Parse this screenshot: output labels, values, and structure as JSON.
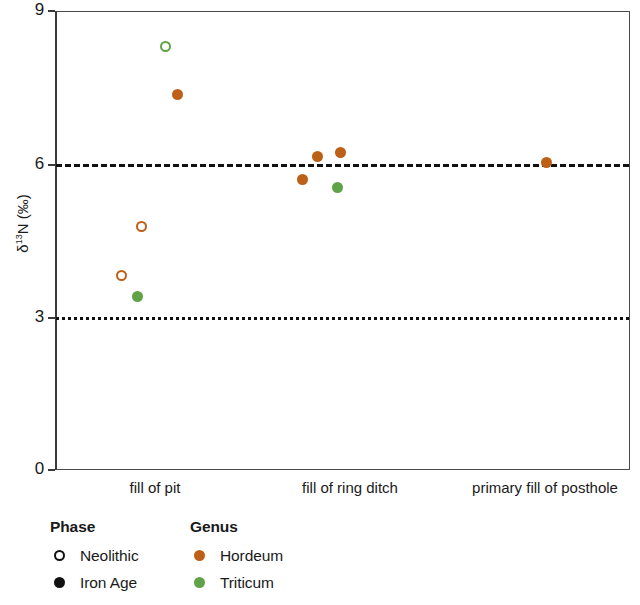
{
  "chart_data": {
    "type": "scatter",
    "title": "",
    "xlabel": "",
    "ylabel": "δ¹³N (‰)",
    "ylim": [
      0,
      9
    ],
    "yticks": [
      0,
      3,
      6,
      9
    ],
    "ytick_labels": [
      "0",
      "3",
      "6",
      "9"
    ],
    "grid": false,
    "categories": [
      "fill of pit",
      "fill of ring ditch",
      "primary fill of posthole"
    ],
    "reference_lines": [
      {
        "value": 6,
        "style": "dashed",
        "color": "#111111"
      },
      {
        "value": 3,
        "style": "dotted",
        "color": "#111111"
      }
    ],
    "series": [
      {
        "name": "Hordeum",
        "genus": "Hordeum",
        "color": "#BD5F17",
        "points": [
          {
            "category": "fill of pit",
            "x_frac": 0.115,
            "y": 7.39,
            "phase": "Iron Age",
            "marker": "filled"
          },
          {
            "category": "fill of pit",
            "x_frac": 0.15,
            "y": 4.79,
            "phase": "Neolithic",
            "marker": "open"
          },
          {
            "category": "fill of pit",
            "x_frac": 0.115,
            "y": 3.83,
            "phase": "Neolithic",
            "marker": "open"
          },
          {
            "category": "fill of ring ditch",
            "x_frac": 0.497,
            "y": 6.25,
            "phase": "Iron Age",
            "marker": "filled"
          },
          {
            "category": "fill of ring ditch",
            "x_frac": 0.457,
            "y": 6.17,
            "phase": "Iron Age",
            "marker": "filled"
          },
          {
            "category": "fill of ring ditch",
            "x_frac": 0.43,
            "y": 5.72,
            "phase": "Iron Age",
            "marker": "filled"
          },
          {
            "category": "primary fill of posthole",
            "x_frac": 0.855,
            "y": 6.05,
            "phase": "Iron Age",
            "marker": "filled"
          }
        ]
      },
      {
        "name": "Triticum",
        "genus": "Triticum",
        "color": "#5FA247",
        "points": [
          {
            "category": "fill of pit",
            "x_frac": 0.192,
            "y": 8.33,
            "phase": "Neolithic",
            "marker": "open"
          },
          {
            "category": "fill of pit",
            "x_frac": 0.143,
            "y": 3.42,
            "phase": "Iron Age",
            "marker": "filled"
          },
          {
            "category": "fill of ring ditch",
            "x_frac": 0.491,
            "y": 5.56,
            "phase": "Iron Age",
            "marker": "filled"
          }
        ]
      }
    ],
    "legends": [
      {
        "title": "Phase",
        "entries": [
          {
            "label": "Neolithic",
            "marker": "open",
            "color": "#111111"
          },
          {
            "label": "Iron Age",
            "marker": "filled",
            "color": "#111111"
          }
        ]
      },
      {
        "title": "Genus",
        "entries": [
          {
            "label": "Hordeum",
            "marker": "filled",
            "color": "#BD5F17"
          },
          {
            "label": "Triticum",
            "marker": "filled",
            "color": "#5FA247"
          }
        ]
      }
    ]
  },
  "axis": {
    "y_title_main": "N (‰)",
    "y_title_delta": "δ",
    "y_title_sup": "13"
  },
  "points_px": [
    {
      "x": 165,
      "y": 46,
      "color": "#5FA247",
      "marker": "open",
      "name": "point-triticum-neolithic-8-33"
    },
    {
      "x": 177,
      "y": 94,
      "color": "#BD5F17",
      "marker": "filled",
      "name": "point-hordeum-ironage-7-39"
    },
    {
      "x": 141,
      "y": 226,
      "color": "#BD5F17",
      "marker": "open",
      "name": "point-hordeum-neolithic-4-79"
    },
    {
      "x": 121,
      "y": 275,
      "color": "#BD5F17",
      "marker": "open",
      "name": "point-hordeum-neolithic-3-83"
    },
    {
      "x": 137,
      "y": 296,
      "color": "#5FA247",
      "marker": "filled",
      "name": "point-triticum-ironage-3-42"
    },
    {
      "x": 340,
      "y": 152,
      "color": "#BD5F17",
      "marker": "filled",
      "name": "point-hordeum-ironage-6-25"
    },
    {
      "x": 317,
      "y": 156,
      "color": "#BD5F17",
      "marker": "filled",
      "name": "point-hordeum-ironage-6-17"
    },
    {
      "x": 302,
      "y": 179,
      "color": "#BD5F17",
      "marker": "filled",
      "name": "point-hordeum-ironage-5-72"
    },
    {
      "x": 337,
      "y": 187,
      "color": "#5FA247",
      "marker": "filled",
      "name": "point-triticum-ironage-5-56"
    },
    {
      "x": 546,
      "y": 162,
      "color": "#BD5F17",
      "marker": "filled",
      "name": "point-hordeum-ironage-6-05"
    }
  ],
  "x_label_px": [
    {
      "x": 155,
      "label_index": 0
    },
    {
      "x": 350,
      "label_index": 1
    },
    {
      "x": 545,
      "label_index": 2
    }
  ]
}
